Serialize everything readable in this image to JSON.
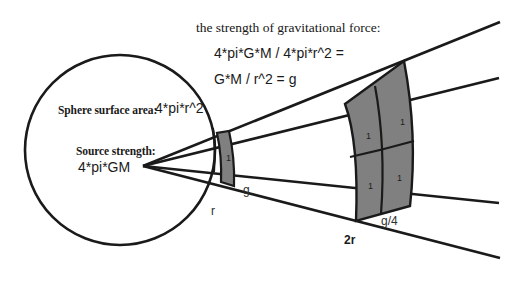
{
  "diagram": {
    "title": "the strength of gravitational force:",
    "equation_line_1": "4*pi*G*M / 4*pi*r^2 =",
    "equation_line_2": "G*M / r^2 = g",
    "sphere_area_label": "Sphere surface area:",
    "sphere_area_value": "4*pi*r^2",
    "source_strength_label": "Source strength:",
    "source_strength_value": "4*pi*GM",
    "radius_label_inner": "r",
    "radius_label_outer": "2r",
    "field_label_inner": "g",
    "field_label_outer": "g/4",
    "near_patch_cells": [
      "1"
    ],
    "far_patch_cells": [
      "1",
      "1",
      "1",
      "1"
    ],
    "colors": {
      "line": "#1a1a1a",
      "patch_fill": "#808080",
      "background": "#ffffff",
      "text": "#1a1a1a"
    }
  }
}
